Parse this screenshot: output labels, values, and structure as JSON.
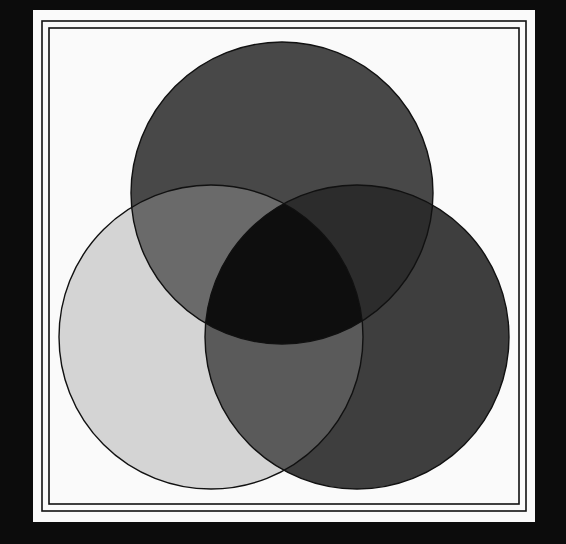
{
  "diagram": {
    "type": "venn",
    "title": "",
    "sets": [
      {
        "id": "top",
        "label": "",
        "cx": 282,
        "cy": 193,
        "r": 151,
        "color": "#484848"
      },
      {
        "id": "left",
        "label": "",
        "cx": 211,
        "cy": 337,
        "r": 152,
        "color": "#d4d4d4"
      },
      {
        "id": "right",
        "label": "",
        "cx": 357,
        "cy": 337,
        "r": 152,
        "color": "#3e3e3e"
      }
    ],
    "intersections": {
      "top_left": "#6a6a6a",
      "top_right": "#2c2c2c",
      "left_right": "#5a5a5a",
      "all": "#0e0e0e"
    },
    "colors": {
      "background": "#0c0c0c",
      "panel": "#fafafa",
      "stroke": "#111111"
    }
  }
}
